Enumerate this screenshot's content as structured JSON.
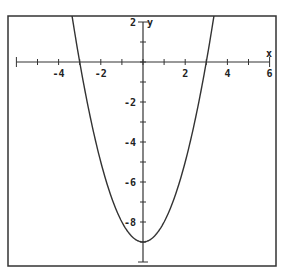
{
  "chart_data": {
    "type": "line",
    "title": "",
    "xlabel": "x",
    "ylabel": "y",
    "xlim": [
      -6,
      6
    ],
    "ylim": [
      -10,
      2
    ],
    "grid": false,
    "legend": null,
    "x_ticks": [
      -6,
      -5,
      -4,
      -3,
      -2,
      -1,
      0,
      1,
      2,
      3,
      4,
      5,
      6
    ],
    "x_tick_labels": [
      "-4",
      "-2",
      "2",
      "4",
      "6"
    ],
    "x_tick_label_values": [
      -4,
      -2,
      2,
      4,
      6
    ],
    "y_ticks": [
      -10,
      -9,
      -8,
      -7,
      -6,
      -5,
      -4,
      -3,
      -2,
      -1,
      0,
      1,
      2
    ],
    "y_tick_labels": [
      "2",
      "-2",
      "-4",
      "-6",
      "-8"
    ],
    "y_tick_label_values": [
      2,
      -2,
      -4,
      -6,
      -8
    ],
    "series": [
      {
        "name": "y = x^2 - 9",
        "equation": "y = x^2 - 9",
        "x": [
          -3.3,
          -3,
          -2.5,
          -2,
          -1.5,
          -1,
          -0.5,
          0,
          0.5,
          1,
          1.5,
          2,
          2.5,
          3,
          3.3
        ],
        "y": [
          1.89,
          0,
          -2.75,
          -5,
          -6.75,
          -8,
          -8.75,
          -9,
          -8.75,
          -8,
          -6.75,
          -5,
          -2.75,
          0,
          1.89
        ],
        "color": "#333333"
      }
    ],
    "annotations": [
      "x-intercepts at x = -3 and x = 3",
      "vertex at (0, -9)"
    ]
  },
  "colors": {
    "frame": "#333333",
    "axis": "#333333",
    "curve": "#333333",
    "background": "#ffffff"
  }
}
